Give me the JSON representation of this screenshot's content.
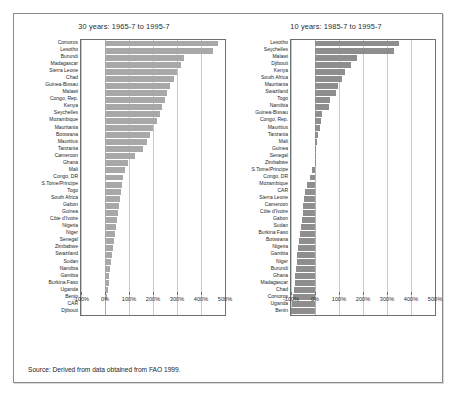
{
  "figure": {
    "source_note": "Source: Derived from data obtained from FAO 1999."
  },
  "chart_data": [
    {
      "type": "bar",
      "orientation": "horizontal",
      "title": "30 years: 1965-7 to 1995-7",
      "xlabel": "",
      "ylabel": "",
      "xlim": [
        -100,
        500
      ],
      "xticks": [
        -100,
        0,
        100,
        200,
        300,
        400,
        500
      ],
      "xticklabels": [
        "-100%",
        "0%",
        "100%",
        "200%",
        "300%",
        "400%",
        "500%"
      ],
      "grid": true,
      "legend": "none",
      "bar_color": "#a8a8a8",
      "categories": [
        "Comoros",
        "Lesotho",
        "Burundi",
        "Madagascar",
        "Sierra Leone",
        "Chad",
        "Guinea-Bissau",
        "Malawi",
        "Congo, Rep.",
        "Kenya",
        "Seychelles",
        "Mozambique",
        "Mauritania",
        "Botswana",
        "Mauritius",
        "Tanzania",
        "Cameroon",
        "Ghana",
        "Mali",
        "Congo, DR",
        "S.Tome/Principe",
        "Togo",
        "South Africa",
        "Gabon",
        "Guinea",
        "Côte d'Ivoire",
        "Nigeria",
        "Niger",
        "Senegal",
        "Zimbabwe",
        "Swaziland",
        "Sudan",
        "Namibia",
        "Gambia",
        "Burkina Faso",
        "Uganda",
        "Benin",
        "CAR",
        "Djibouti"
      ],
      "values": [
        470,
        452,
        330,
        318,
        300,
        288,
        272,
        258,
        248,
        238,
        228,
        215,
        200,
        188,
        175,
        160,
        126,
        96,
        84,
        74,
        70,
        66,
        62,
        58,
        54,
        50,
        46,
        42,
        38,
        34,
        30,
        26,
        22,
        18,
        15,
        12,
        9,
        6,
        2
      ]
    },
    {
      "type": "bar",
      "orientation": "horizontal",
      "title": "10 years: 1985-7 to 1995-7",
      "xlabel": "",
      "ylabel": "",
      "xlim": [
        -100,
        500
      ],
      "xticks": [
        -100,
        0,
        100,
        200,
        300,
        400,
        500
      ],
      "xticklabels": [
        "-100%",
        "0%",
        "100%",
        "200%",
        "300%",
        "400%",
        "500%"
      ],
      "grid": true,
      "legend": "none",
      "bar_color": "#8e8e8e",
      "categories": [
        "Lesotho",
        "Seychelles",
        "Malawi",
        "Djibouti",
        "Kenya",
        "South Africa",
        "Mauritania",
        "Swaziland",
        "Togo",
        "Namibia",
        "Guinea-Bissau",
        "Congo, Rep.",
        "Mauritius",
        "Tanzania",
        "Mali",
        "Guinea",
        "Senegal",
        "Zimbabwe",
        "S.Tome/Principe",
        "Congo, DR",
        "Mozambique",
        "CAR",
        "Sierra Leone",
        "Cameroon",
        "Côte d'Ivoire",
        "Gabon",
        "Sudan",
        "Burkina Faso",
        "Botswana",
        "Nigeria",
        "Gambia",
        "Niger",
        "Burundi",
        "Ghana",
        "Madagascar",
        "Chad",
        "Comoros",
        "Uganda",
        "Benin"
      ],
      "values": [
        350,
        330,
        175,
        150,
        125,
        112,
        96,
        86,
        62,
        58,
        30,
        26,
        20,
        14,
        8,
        4,
        2,
        1,
        -12,
        -22,
        -34,
        -40,
        -44,
        -48,
        -52,
        -56,
        -60,
        -63,
        -66,
        -70,
        -73,
        -76,
        -79,
        -82,
        -85,
        -88,
        -92,
        -96,
        -100
      ]
    }
  ]
}
